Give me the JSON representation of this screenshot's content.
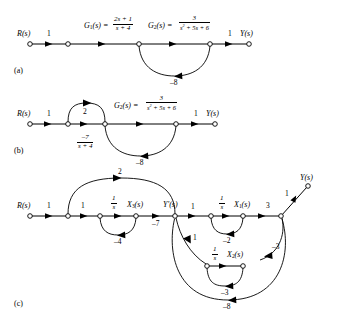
{
  "figure": {
    "type": "signal-flow-graph",
    "background": "#ffffff",
    "stroke": "#000000",
    "panels": [
      {
        "id": "a",
        "label": "(a)",
        "nodes": [
          "R(s)",
          "",
          "",
          "",
          "Y(s)"
        ],
        "input_label": "R(s)",
        "output_label": "Y(s)",
        "edge_labels": [
          "1",
          "G1(s) = (2s+1)/(s+4)",
          "G2(s) = 3/(s^2+5s+6)",
          "1"
        ],
        "feedback_label": "-8"
      },
      {
        "id": "b",
        "label": "(b)",
        "input_label": "R(s)",
        "output_label": "Y(s)",
        "edge_labels": [
          "1",
          "2",
          "-7/(s+4)",
          "G2(s) = 3/(s^2+5s+6)",
          "1"
        ],
        "feedback_label": "-8"
      },
      {
        "id": "c",
        "label": "(c)",
        "input_label": "R(s)",
        "output_label": "Y(s)",
        "state_labels": [
          "X3(s)",
          "Yp(s)",
          "X1(s)",
          "X2(s)"
        ],
        "edge_labels": [
          "1",
          "1",
          "2",
          "1/s",
          "-4",
          "-7",
          "1",
          "1/s",
          "-2",
          "3",
          "1",
          "1/s",
          "-3",
          "-3",
          "-8"
        ]
      }
    ]
  },
  "panel_a": {
    "source_node": "R(s)",
    "sink_node": "Y(s)",
    "gain_in": "1",
    "gain_out": "1",
    "g1_name": "G",
    "g1_sub": "1",
    "g1_arg": "(s) =",
    "g1_num": "2s + 1",
    "g1_den": "s + 4",
    "g2_name": "G",
    "g2_sub": "2",
    "g2_arg": "(s) =",
    "g2_num": "3",
    "g2_den_pre": "s",
    "g2_den_exp": "2",
    "g2_den_post": " + 5s + 6",
    "feedback": "–8",
    "panel_label": "(a)"
  },
  "panel_b": {
    "source_node": "R(s)",
    "sink_node": "Y(s)",
    "gain_in": "1",
    "gain_out": "1",
    "arc_gain": "2",
    "straight_num": "–7",
    "straight_den": "s + 4",
    "g2_name": "G",
    "g2_sub": "2",
    "g2_arg": "(s) =",
    "g2_num": "3",
    "g2_den_pre": "s",
    "g2_den_exp": "2",
    "g2_den_post": " + 5s + 6",
    "feedback": "–8",
    "panel_label": "(b)"
  },
  "panel_c": {
    "source_node": "R(s)",
    "sink_node": "Y(s)",
    "gain_r1": "1",
    "gain_r2": "1",
    "arc_top": "2",
    "integrator3_num": "1",
    "integrator3_den": "s",
    "x3_name": "X",
    "x3_sub": "3",
    "x3_arg": "(s)",
    "self_loop_x3": "–4",
    "gain_x3_to_y": "–7",
    "yp_name": "Y",
    "yp_prime": "′",
    "yp_arg": "(s)",
    "gain_y_to_1": "1",
    "integrator1_num": "1",
    "integrator1_den": "s",
    "x1_name": "X",
    "x1_sub": "1",
    "x1_arg": "(s)",
    "self_loop_x1": "–2",
    "gain_x1_out": "3",
    "gain_out": "1",
    "gain_y_to_2": "1",
    "integrator2_num": "1",
    "integrator2_den": "s",
    "x2_name": "X",
    "x2_sub": "2",
    "x2_arg": "(s)",
    "self_loop_x2": "–3",
    "gain_x2_fb": "–3",
    "gain_big_fb": "–8",
    "panel_label": "(c)"
  }
}
